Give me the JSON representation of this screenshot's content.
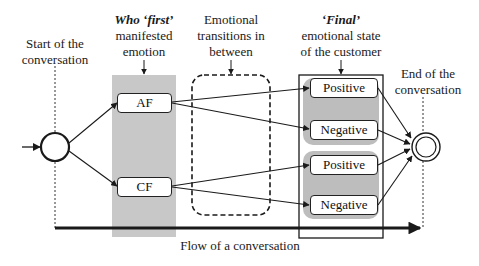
{
  "labels": {
    "start": [
      "Start of the",
      "conversation"
    ],
    "who_first_bold": "Who ‘first’",
    "who_first_rest": [
      "manifested",
      "emotion"
    ],
    "transitions": [
      "Emotional",
      "transitions in",
      "between"
    ],
    "final_bold": "‘Final’",
    "final_rest": [
      "emotional state",
      "of the customer"
    ],
    "end": [
      "End of the",
      "conversation"
    ],
    "flow": "Flow of a conversation"
  },
  "nodes": {
    "af": "AF",
    "cf": "CF",
    "final_states": [
      "Positive",
      "Negative",
      "Positive",
      "Negative"
    ]
  },
  "colors": {
    "gray_band": "#c8c8c8",
    "group_fill": "#bdbdbd",
    "stroke": "#1a1a1a"
  }
}
